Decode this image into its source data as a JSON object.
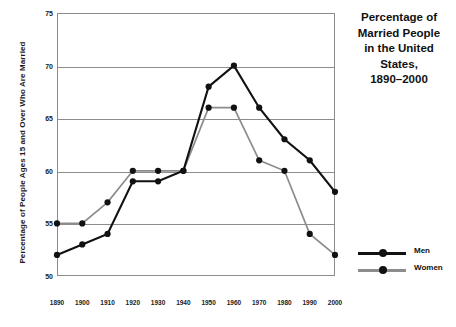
{
  "chart_data": {
    "type": "line",
    "title_lines": [
      "Percentage of",
      "Married People",
      "in the United",
      "States,",
      "1890–2000"
    ],
    "xlabel": "",
    "ylabel": "Percentage of People Ages 15 and Over Who Are Married",
    "categories": [
      1890,
      1900,
      1910,
      1920,
      1930,
      1940,
      1950,
      1960,
      1970,
      1980,
      1990,
      2000
    ],
    "xtick_labels": [
      "1890",
      "1900",
      "1910",
      "1920",
      "1930",
      "1940",
      "1950",
      "1960",
      "1970",
      "1980",
      "1990",
      "2000"
    ],
    "ytick_labels": [
      "50",
      "55",
      "60",
      "65",
      "70",
      "75"
    ],
    "ytick_values": [
      50,
      55,
      60,
      65,
      70,
      75
    ],
    "ylim": [
      50,
      75
    ],
    "xlim": [
      1890,
      2000
    ],
    "grid": true,
    "legend_position": "right",
    "series": [
      {
        "name": "Men",
        "color": "#111111",
        "values": [
          52,
          53,
          54,
          59,
          59,
          60,
          68,
          70,
          66,
          63,
          61,
          58
        ]
      },
      {
        "name": "Women",
        "color": "#8c8c8c",
        "values": [
          55,
          55,
          57,
          60,
          60,
          60,
          66,
          66,
          61,
          60,
          54,
          52
        ]
      }
    ]
  },
  "legend": {
    "items": [
      {
        "label": "Men"
      },
      {
        "label": "Women"
      }
    ]
  }
}
